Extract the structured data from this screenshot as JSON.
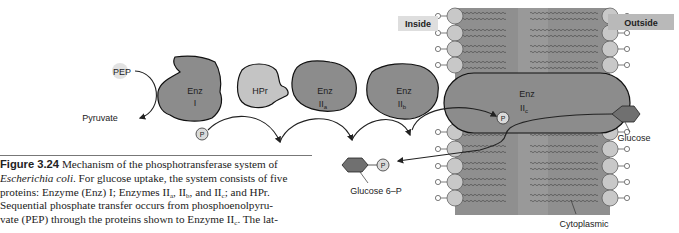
{
  "diagram": {
    "labels": {
      "inside": "Inside",
      "outside": "Outside",
      "pep": "PEP",
      "pyruvate": "Pyruvate",
      "glucose": "Glucose",
      "glucose6p": "Glucose 6–P",
      "cytoplasmic": "Cytoplasmic",
      "phosphate": "P"
    },
    "proteins": [
      {
        "name": "Enz",
        "sub": "I",
        "subscript": ""
      },
      {
        "name": "HPr",
        "sub": "",
        "subscript": ""
      },
      {
        "name": "Enz",
        "sub": "II",
        "subscript": "a"
      },
      {
        "name": "Enz",
        "sub": "II",
        "subscript": "b"
      },
      {
        "name": "Enz",
        "sub": "II",
        "subscript": "c"
      }
    ],
    "colors": {
      "enz_dark": "#8c8c8c",
      "enz_mid": "#9a9a9a",
      "hpr_light": "#c4c4c4",
      "membrane": "#8f8f8f",
      "lipid_head": "#c8c8c8",
      "label_bg": "#dedede",
      "outside_bg": "#b9b9b9"
    }
  },
  "caption": {
    "figure_label": "Figure 3.24",
    "line1_rest": " Mechanism of the phosphotransferase system of",
    "line2_italic": "Escherichia coli",
    "line2_rest": ". For glucose uptake, the system consists of five",
    "line3_a": "proteins: Enzyme (Enz) I; Enzymes II",
    "line3_sub_a": "a",
    "line3_b": ", II",
    "line3_sub_b": "b",
    "line3_c": ", and II",
    "line3_sub_c": "c",
    "line3_d": "; and HPr.",
    "line4": "Sequential phosphate transfer occurs from phosphoenolpyru-",
    "line5_a": "vate (PEP) through the proteins shown to Enzyme II",
    "line5_sub": "c",
    "line5_b": ". The lat-"
  }
}
